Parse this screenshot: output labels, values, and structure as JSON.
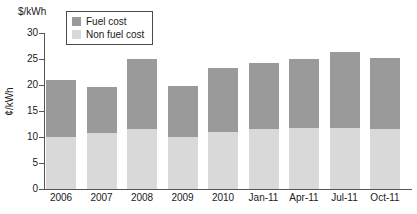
{
  "chart_data": {
    "type": "bar",
    "subtype": "stacked-vertical",
    "title": "",
    "top_unit_label": "$/kWh",
    "xlabel": "",
    "ylabel": "¢/kWh",
    "ylim": [
      0,
      30
    ],
    "ytick_step": 5,
    "yticks": [
      30,
      25,
      20,
      15,
      10,
      5,
      0
    ],
    "ytick_labels": [
      "30",
      "25",
      "20",
      "15",
      "10",
      "5",
      "0"
    ],
    "grid": false,
    "legend_position": "top-left-inside",
    "categories": [
      "2006",
      "2007",
      "2008",
      "2009",
      "2010",
      "Jan-11",
      "Apr-11",
      "Jul-11",
      "Oct-11"
    ],
    "series": [
      {
        "name": "Non fuel cost",
        "color": "#d9d9d9",
        "values": [
          10.0,
          10.7,
          11.5,
          10.0,
          11.0,
          11.5,
          11.8,
          11.8,
          11.5
        ]
      },
      {
        "name": "Fuel cost",
        "color": "#9a9a9a",
        "values": [
          11.0,
          8.9,
          13.5,
          9.8,
          12.2,
          12.8,
          13.2,
          14.6,
          13.6
        ]
      }
    ],
    "totals": [
      21.0,
      19.6,
      25.0,
      19.8,
      23.2,
      24.3,
      25.0,
      26.4,
      25.1
    ]
  },
  "legend": {
    "items": [
      {
        "label": "Fuel cost",
        "color": "#9a9a9a"
      },
      {
        "label": "Non fuel cost",
        "color": "#d9d9d9"
      }
    ]
  },
  "colors": {
    "fuel": "#9a9a9a",
    "non_fuel": "#d9d9d9",
    "axis": "#555555",
    "text": "#1a1a1a",
    "background": "#ffffff"
  }
}
